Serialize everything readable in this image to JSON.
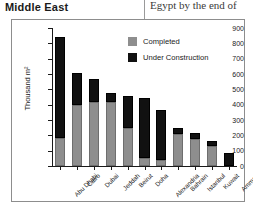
{
  "header": {
    "region_heading": "Middle East",
    "adjacent_column_text": "Egypt by the end of"
  },
  "source_note": "Source: Retail International",
  "legend": {
    "position": "top-right",
    "items": [
      {
        "label": "Completed",
        "color": "#8e8e8e",
        "icon": "square-swatch-icon"
      },
      {
        "label": "Under Construction",
        "color": "#111111",
        "icon": "square-swatch-icon"
      }
    ]
  },
  "chart_data": {
    "type": "bar",
    "stacked": true,
    "title": "",
    "xlabel": "",
    "ylabel": "Thousand m²",
    "ylim": [
      0,
      900
    ],
    "ytick_step": 100,
    "yticks": [
      "0",
      "100",
      "200",
      "300",
      "400",
      "500",
      "600",
      "700",
      "800",
      "900"
    ],
    "grid": false,
    "categories": [
      "Abu Dhabi",
      "Cairo",
      "Dubai",
      "Jeddah",
      "Beirut",
      "Doha",
      "Alexandria",
      "Bahrain",
      "Istanbul",
      "Kuwait",
      "Amman"
    ],
    "series": [
      {
        "name": "Completed",
        "color": "#8e8e8e",
        "values": [
          185,
          395,
          415,
          420,
          245,
          50,
          42,
          210,
          175,
          130,
          0
        ]
      },
      {
        "name": "Under Construction",
        "color": "#111111",
        "values": [
          655,
          210,
          153,
          55,
          213,
          395,
          321,
          37,
          43,
          33,
          85
        ]
      }
    ],
    "totals": [
      840,
      605,
      568,
      475,
      458,
      445,
      363,
      247,
      218,
      163,
      85
    ]
  }
}
